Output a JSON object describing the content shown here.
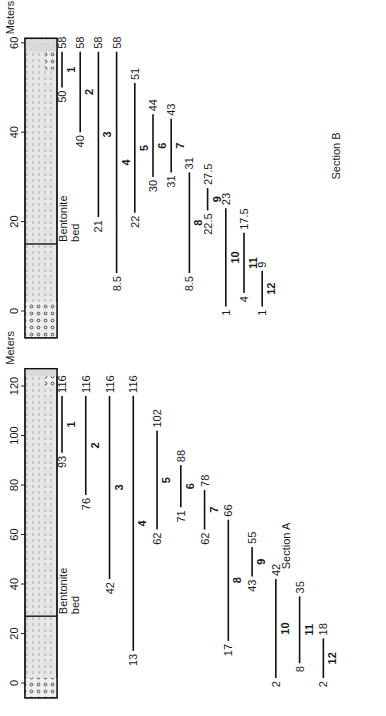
{
  "figure": {
    "rotation": "image displayed rotated 90 degrees counter-clockwise",
    "axis_unit_label": "Meters"
  },
  "sections": [
    {
      "title": "Section A",
      "axis_ticks": [
        0,
        20,
        40,
        60,
        80,
        100,
        120
      ],
      "axis_label": "Meters",
      "bentonite_label_line1": "Bentonite",
      "bentonite_label_line2": "bed",
      "bentonite_height_m": 27,
      "column_top_m": 127,
      "ranges": [
        {
          "id": "1",
          "top": 116,
          "base": 93
        },
        {
          "id": "2",
          "top": 116,
          "base": 76
        },
        {
          "id": "3",
          "top": 116,
          "base": 42
        },
        {
          "id": "4",
          "top": 116,
          "base": 13
        },
        {
          "id": "5",
          "top": 102,
          "base": 62
        },
        {
          "id": "6",
          "top": 88,
          "base": 71
        },
        {
          "id": "7",
          "top": 78,
          "base": 62
        },
        {
          "id": "8",
          "top": 66,
          "base": 17
        },
        {
          "id": "9",
          "top": 55,
          "base": 43
        },
        {
          "id": "10",
          "top": 42,
          "base": 2
        },
        {
          "id": "11",
          "top": 35,
          "base": 8
        },
        {
          "id": "12",
          "top": 18,
          "base": 2
        }
      ]
    },
    {
      "title": "Section B",
      "axis_ticks": [
        0,
        20,
        40,
        60
      ],
      "axis_label": "Meters",
      "bentonite_label_line1": "Bentonite",
      "bentonite_label_line2": "bed",
      "bentonite_height_m": 15,
      "column_top_m": 61,
      "ranges": [
        {
          "id": "1",
          "top": 58,
          "base": 50
        },
        {
          "id": "2",
          "top": 58,
          "base": 40
        },
        {
          "id": "3",
          "top": 58,
          "base": 21
        },
        {
          "id": "4",
          "top": 58,
          "base": 8.5
        },
        {
          "id": "5",
          "top": 51,
          "base": 22
        },
        {
          "id": "6",
          "top": 44,
          "base": 30
        },
        {
          "id": "7",
          "top": 43,
          "base": 31
        },
        {
          "id": "8",
          "top": 31,
          "base": 8.5
        },
        {
          "id": "9",
          "top": 27.5,
          "base": 22.5
        },
        {
          "id": "10",
          "top": 23,
          "base": 1
        },
        {
          "id": "11",
          "top": 17.5,
          "base": 4
        },
        {
          "id": "12",
          "top": 9,
          "base": 1
        }
      ]
    }
  ]
}
